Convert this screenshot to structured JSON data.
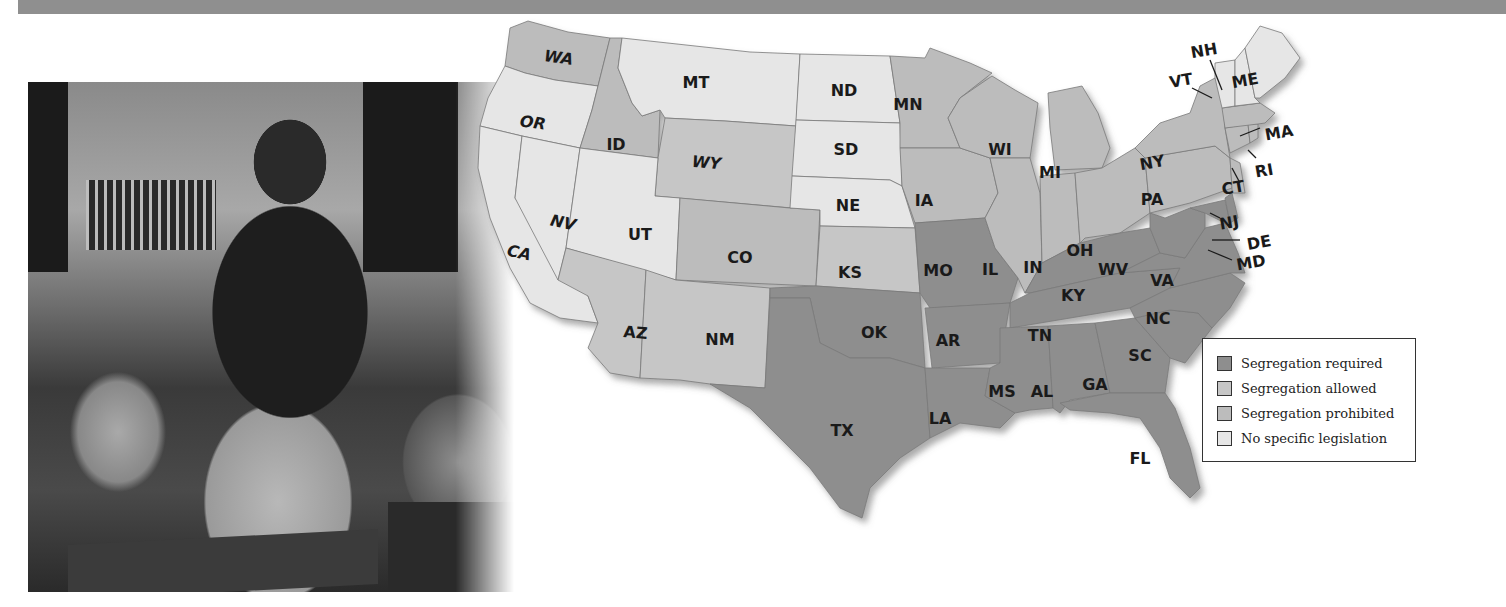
{
  "header": {
    "band_color": "#8f8f8f"
  },
  "photo": {
    "subject": "classroom-photograph",
    "description": "Teacher standing with book among seated students at desks"
  },
  "map": {
    "colors": {
      "required": "#8e8e8e",
      "allowed": "#c6c6c6",
      "prohibited": "#bcbcbc",
      "none": "#e6e6e6"
    },
    "states": [
      {
        "abbr": "WA",
        "category": "prohibited"
      },
      {
        "abbr": "OR",
        "category": "none"
      },
      {
        "abbr": "CA",
        "category": "none"
      },
      {
        "abbr": "ID",
        "category": "prohibited"
      },
      {
        "abbr": "NV",
        "category": "none"
      },
      {
        "abbr": "MT",
        "category": "none"
      },
      {
        "abbr": "WY",
        "category": "allowed"
      },
      {
        "abbr": "UT",
        "category": "none"
      },
      {
        "abbr": "CO",
        "category": "prohibited"
      },
      {
        "abbr": "AZ",
        "category": "allowed"
      },
      {
        "abbr": "NM",
        "category": "allowed"
      },
      {
        "abbr": "ND",
        "category": "none"
      },
      {
        "abbr": "SD",
        "category": "none"
      },
      {
        "abbr": "NE",
        "category": "none"
      },
      {
        "abbr": "KS",
        "category": "allowed"
      },
      {
        "abbr": "OK",
        "category": "required"
      },
      {
        "abbr": "TX",
        "category": "required"
      },
      {
        "abbr": "MN",
        "category": "prohibited"
      },
      {
        "abbr": "IA",
        "category": "prohibited"
      },
      {
        "abbr": "MO",
        "category": "required"
      },
      {
        "abbr": "AR",
        "category": "required"
      },
      {
        "abbr": "LA",
        "category": "required"
      },
      {
        "abbr": "WI",
        "category": "prohibited"
      },
      {
        "abbr": "IL",
        "category": "prohibited"
      },
      {
        "abbr": "MI",
        "category": "prohibited"
      },
      {
        "abbr": "IN",
        "category": "prohibited"
      },
      {
        "abbr": "OH",
        "category": "prohibited"
      },
      {
        "abbr": "KY",
        "category": "required"
      },
      {
        "abbr": "TN",
        "category": "required"
      },
      {
        "abbr": "MS",
        "category": "required"
      },
      {
        "abbr": "AL",
        "category": "required"
      },
      {
        "abbr": "GA",
        "category": "required"
      },
      {
        "abbr": "FL",
        "category": "required"
      },
      {
        "abbr": "SC",
        "category": "required"
      },
      {
        "abbr": "NC",
        "category": "required"
      },
      {
        "abbr": "VA",
        "category": "required"
      },
      {
        "abbr": "WV",
        "category": "required"
      },
      {
        "abbr": "PA",
        "category": "prohibited"
      },
      {
        "abbr": "NY",
        "category": "prohibited"
      },
      {
        "abbr": "VT",
        "category": "none"
      },
      {
        "abbr": "NH",
        "category": "none"
      },
      {
        "abbr": "ME",
        "category": "none"
      },
      {
        "abbr": "MA",
        "category": "prohibited"
      },
      {
        "abbr": "RI",
        "category": "prohibited"
      },
      {
        "abbr": "CT",
        "category": "prohibited"
      },
      {
        "abbr": "NJ",
        "category": "prohibited"
      },
      {
        "abbr": "DE",
        "category": "required"
      },
      {
        "abbr": "MD",
        "category": "required"
      }
    ],
    "labels": {
      "WA": "WA",
      "OR": "OR",
      "CA": "CA",
      "ID": "ID",
      "NV": "NV",
      "MT": "MT",
      "WY": "WY",
      "UT": "UT",
      "CO": "CO",
      "AZ": "AZ",
      "NM": "NM",
      "ND": "ND",
      "SD": "SD",
      "NE": "NE",
      "KS": "KS",
      "OK": "OK",
      "TX": "TX",
      "MN": "MN",
      "IA": "IA",
      "MO": "MO",
      "AR": "AR",
      "LA": "LA",
      "WI": "WI",
      "IL": "IL",
      "MI": "MI",
      "IN": "IN",
      "OH": "OH",
      "KY": "KY",
      "TN": "TN",
      "MS": "MS",
      "AL": "AL",
      "GA": "GA",
      "FL": "FL",
      "SC": "SC",
      "NC": "NC",
      "VA": "VA",
      "WV": "WV",
      "PA": "PA",
      "NY": "NY",
      "VT": "VT",
      "NH": "NH",
      "ME": "ME",
      "MA": "MA",
      "RI": "RI",
      "CT": "CT",
      "NJ": "NJ",
      "DE": "DE",
      "MD": "MD"
    }
  },
  "legend": {
    "items": [
      {
        "label": "Segregation required",
        "color": "#8e8e8e"
      },
      {
        "label": "Segregation allowed",
        "color": "#c6c6c6"
      },
      {
        "label": "Segregation prohibited",
        "color": "#bcbcbc"
      },
      {
        "label": "No specific legislation",
        "color": "#e6e6e6"
      }
    ]
  }
}
